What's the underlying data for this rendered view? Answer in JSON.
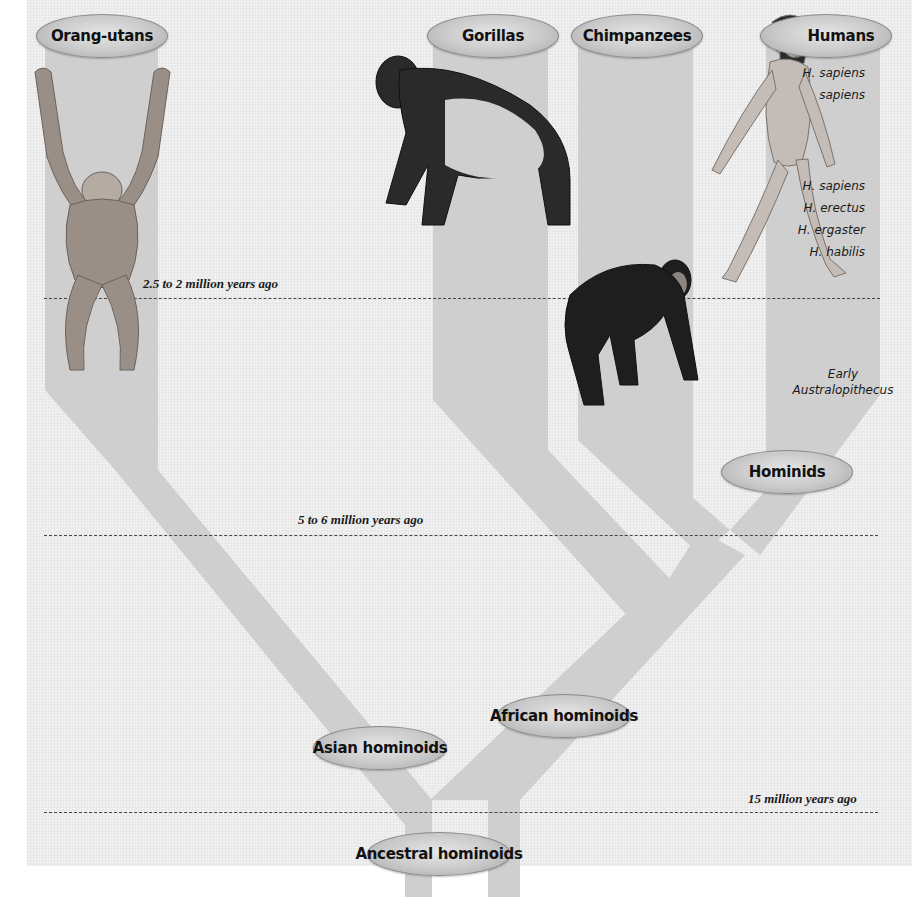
{
  "colors": {
    "panel": "#ececec",
    "branch": "#cfcfcf",
    "pill_mid": "#c9c9c9",
    "text": "#111111",
    "dash": "#444444"
  },
  "taxa": {
    "orangutans": "Orang-utans",
    "gorillas": "Gorillas",
    "chimpanzees": "Chimpanzees",
    "humans": "Humans",
    "hominids": "Hominids",
    "african_hominoids": "African hominoids",
    "asian_hominoids": "Asian hominoids",
    "ancestral_hominoids": "Ancestral hominoids"
  },
  "human_species": {
    "modern_line1": "H. sapiens",
    "modern_line2": "sapiens",
    "list": [
      "H. sapiens",
      "H. erectus",
      "H. ergaster",
      "H. habilis"
    ]
  },
  "early_stage": {
    "line1": "Early",
    "line2": "Australopithecus"
  },
  "time_markers": {
    "t1": "2.5 to 2 million years ago",
    "t2": "5 to 6 million years ago",
    "t3": "15 million years ago"
  },
  "illustrations": {
    "orangutan": "orangutan-figure",
    "gorilla": "gorilla-figure",
    "chimpanzee": "chimpanzee-figure",
    "human": "human-figure"
  }
}
